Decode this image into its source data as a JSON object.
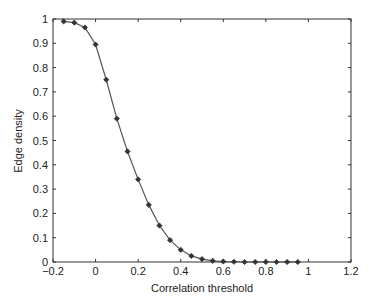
{
  "chart_data": {
    "type": "line",
    "title": "",
    "xlabel": "Correlation threshold",
    "ylabel": "Edge density",
    "xlim": [
      -0.2,
      1.2
    ],
    "ylim": [
      0,
      1
    ],
    "xticks": [
      -0.2,
      0,
      0.2,
      0.4,
      0.6,
      0.8,
      1,
      1.2
    ],
    "xtick_labels": [
      "−0.2",
      "0",
      "0.2",
      "0.4",
      "0.6",
      "0.8",
      "1",
      "1.2"
    ],
    "yticks": [
      0,
      0.1,
      0.2,
      0.3,
      0.4,
      0.5,
      0.6,
      0.7,
      0.8,
      0.9,
      1
    ],
    "ytick_labels": [
      "0",
      "0.1",
      "0.2",
      "0.3",
      "0.4",
      "0.5",
      "0.6",
      "0.7",
      "0.8",
      "0.9",
      "1"
    ],
    "grid": false,
    "legend": null,
    "series": [
      {
        "name": "Edge density",
        "color": "#555555",
        "marker": "diamond",
        "x": [
          -0.15,
          -0.1,
          -0.05,
          0,
          0.05,
          0.1,
          0.15,
          0.2,
          0.25,
          0.3,
          0.35,
          0.4,
          0.45,
          0.5,
          0.55,
          0.6,
          0.65,
          0.7,
          0.75,
          0.8,
          0.85,
          0.9,
          0.95
        ],
        "values": [
          0.99,
          0.985,
          0.965,
          0.895,
          0.75,
          0.59,
          0.455,
          0.34,
          0.235,
          0.15,
          0.09,
          0.05,
          0.025,
          0.012,
          0.005,
          0.002,
          0.001,
          0.0,
          0.0,
          0.0,
          0.0,
          0.0,
          0.0
        ]
      }
    ]
  }
}
